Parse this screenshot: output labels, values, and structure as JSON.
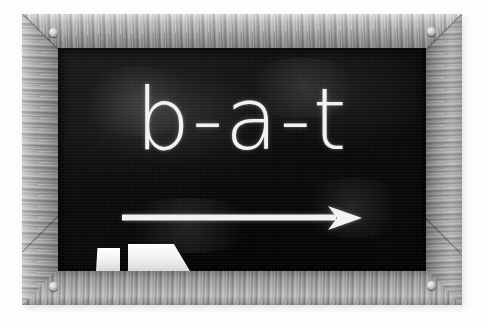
{
  "scene": {
    "title": "Chalkboard with the word bat spelled out",
    "background_color": "#fdfdfd",
    "medium": "grayscale photograph"
  },
  "frame": {
    "name": "wooden picture frame",
    "material": "wood",
    "grain": "visible vertical and horizontal wood grain",
    "color_light": "#d3d3d3",
    "color_mid": "#9a9a9a",
    "color_dark": "#6e6e6e",
    "corners_mitred": true,
    "screws": [
      {
        "position": "top-left"
      },
      {
        "position": "top-right"
      },
      {
        "position": "bottom-left"
      },
      {
        "position": "bottom-right"
      }
    ]
  },
  "board": {
    "name": "chalkboard surface",
    "color": "#0b0b0b",
    "texture": "mottled chalk dust",
    "smudges": [
      {
        "left": 20,
        "top": 18,
        "width": 120,
        "height": 70
      },
      {
        "left": 180,
        "top": 10,
        "width": 130,
        "height": 60
      },
      {
        "left": 55,
        "top": 150,
        "width": 150,
        "height": 55
      },
      {
        "left": 240,
        "top": 130,
        "width": 110,
        "height": 60
      }
    ]
  },
  "writing": {
    "word": "b-a-t",
    "letters": [
      "b",
      "a",
      "t"
    ],
    "separator": "-",
    "plain_word": "bat",
    "chalk_color": "#f2f2f2",
    "style": "geometric sans-serif chalk lettering"
  },
  "arrow": {
    "name": "left-to-right blending arrow",
    "direction": "right",
    "color": "#f2f2f2",
    "meaning": "blend the sounds from left to right"
  },
  "tray": {
    "items": [
      {
        "label": "chalk stick",
        "color": "#f5f5f5"
      },
      {
        "label": "chalkboard eraser",
        "color": "#f2f2f2"
      }
    ]
  }
}
